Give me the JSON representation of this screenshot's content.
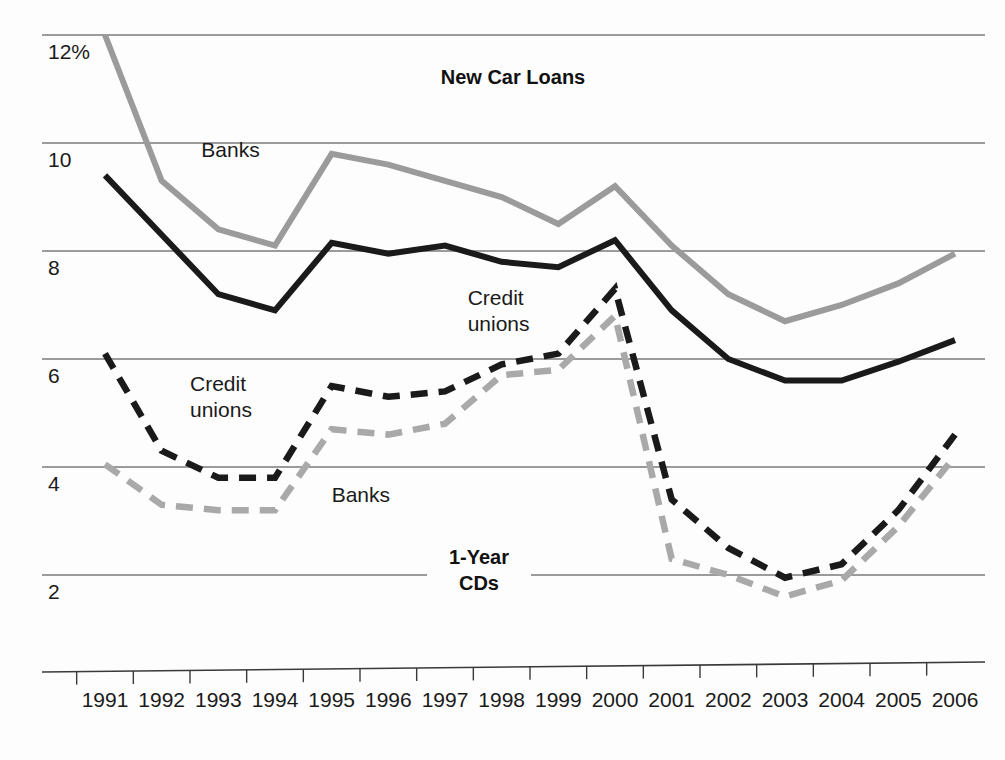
{
  "chart_data": {
    "type": "line",
    "title": "",
    "xlabel": "",
    "ylabel": "",
    "grid": true,
    "legend_position": "inline-annotations",
    "x": [
      1991,
      1992,
      1993,
      1994,
      1995,
      1996,
      1997,
      1998,
      1999,
      2000,
      2001,
      2002,
      2003,
      2004,
      2005,
      2006
    ],
    "categories": [
      "1991",
      "1992",
      "1993",
      "1994",
      "1995",
      "1996",
      "1997",
      "1998",
      "1999",
      "2000",
      "2001",
      "2002",
      "2003",
      "2004",
      "2005",
      "2006"
    ],
    "ylim": [
      0,
      12.9
    ],
    "ytick_values": [
      12,
      10,
      8,
      6,
      4,
      2
    ],
    "ytick_labels": [
      "12%",
      "10",
      "8",
      "6",
      "4",
      "2"
    ],
    "groups": [
      {
        "name": "New Car Loans",
        "label": "New Car Loans",
        "style": "solid"
      },
      {
        "name": "1-Year CDs",
        "label_line1": "1-Year",
        "label_line2": "CDs",
        "style": "dashed"
      }
    ],
    "series": [
      {
        "name": "New Car Loans - Banks",
        "group": "New Car Loans",
        "annotation": "Banks",
        "color": "#9b9b9b",
        "style": "solid",
        "values": [
          12.0,
          9.3,
          8.4,
          8.1,
          9.8,
          9.6,
          9.3,
          9.0,
          8.5,
          9.2,
          8.1,
          7.2,
          6.7,
          7.0,
          7.4,
          7.95
        ]
      },
      {
        "name": "New Car Loans - Credit unions",
        "group": "New Car Loans",
        "annotation_line1": "Credit",
        "annotation_line2": "unions",
        "color": "#1a1a1a",
        "style": "solid",
        "values": [
          9.4,
          8.3,
          7.2,
          6.9,
          8.15,
          7.95,
          8.1,
          7.8,
          7.7,
          8.2,
          6.9,
          6.0,
          5.6,
          5.6,
          5.95,
          6.35
        ]
      },
      {
        "name": "1-Year CDs - Credit unions",
        "group": "1-Year CDs",
        "annotation_line1": "Credit",
        "annotation_line2": "unions",
        "color": "#1a1a1a",
        "style": "dashed",
        "values": [
          6.1,
          4.3,
          3.8,
          3.8,
          5.5,
          5.3,
          5.4,
          5.9,
          6.1,
          7.3,
          3.4,
          2.5,
          1.95,
          2.2,
          3.2,
          4.6
        ]
      },
      {
        "name": "1-Year CDs - Banks",
        "group": "1-Year CDs",
        "annotation": "Banks",
        "color": "#a9a9a9",
        "style": "dashed",
        "values": [
          4.05,
          3.3,
          3.2,
          3.2,
          4.7,
          4.6,
          4.8,
          5.7,
          5.8,
          6.8,
          2.3,
          2.0,
          1.6,
          1.9,
          2.9,
          4.2
        ]
      }
    ],
    "annotations": [
      {
        "text": "New Car Loans",
        "x": 1998.2,
        "y": 11.1,
        "bold": true
      },
      {
        "text": "1-Year CDs",
        "x": 1997.6,
        "y": 2.2,
        "bold": true
      },
      {
        "text": "Banks",
        "x": 1992.7,
        "y": 9.75
      },
      {
        "text": "Credit unions",
        "x": 1997.4,
        "y": 7.0
      },
      {
        "text": "Credit unions",
        "x": 1992.5,
        "y": 5.4
      },
      {
        "text": "Banks",
        "x": 1995.0,
        "y": 3.35
      }
    ]
  }
}
